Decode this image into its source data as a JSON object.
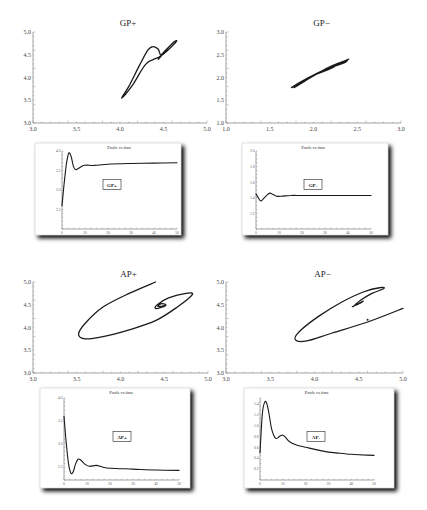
{
  "chart_data": [
    {
      "id": "gp-plus-phase",
      "type": "line",
      "title": "GP+",
      "xlabel": "",
      "ylabel": "",
      "xlim": [
        3.0,
        5.0
      ],
      "ylim": [
        3.0,
        5.0
      ],
      "xticks": [
        "3.0",
        "3.5",
        "4.0",
        "4.5",
        "5.0"
      ],
      "yticks": [
        "3.0",
        "3.5",
        "4.0",
        "4.5",
        "5.0"
      ],
      "grid": false,
      "series": [
        {
          "name": "trajectory",
          "points": [
            [
              4.45,
              4.42
            ],
            [
              4.6,
              4.75
            ],
            [
              4.65,
              4.8
            ],
            [
              4.55,
              4.6
            ],
            [
              4.45,
              4.45
            ],
            [
              4.3,
              4.3
            ],
            [
              4.15,
              3.85
            ],
            [
              4.02,
              3.55
            ],
            [
              4.1,
              3.8
            ],
            [
              4.22,
              4.25
            ],
            [
              4.32,
              4.6
            ],
            [
              4.38,
              4.68
            ],
            [
              4.44,
              4.62
            ],
            [
              4.47,
              4.5
            ],
            [
              4.55,
              4.65
            ],
            [
              4.62,
              4.78
            ],
            [
              4.5,
              4.55
            ],
            [
              4.44,
              4.4
            ]
          ]
        }
      ]
    },
    {
      "id": "gp-minus-phase",
      "type": "line",
      "title": "GP−",
      "xlabel": "",
      "ylabel": "",
      "xlim": [
        1.0,
        3.0
      ],
      "ylim": [
        1.0,
        3.0
      ],
      "xticks": [
        "1.0",
        "1.5",
        "2.0",
        "2.5",
        "3.0"
      ],
      "yticks": [
        "1.0",
        "1.5",
        "2.0",
        "2.5",
        "3.0"
      ],
      "grid": false,
      "series": [
        {
          "name": "trajectory",
          "points": [
            [
              2.3,
              2.32
            ],
            [
              2.4,
              2.4
            ],
            [
              2.2,
              2.2
            ],
            [
              1.95,
              2.0
            ],
            [
              1.75,
              1.78
            ],
            [
              1.85,
              1.9
            ],
            [
              2.05,
              2.1
            ],
            [
              2.25,
              2.28
            ],
            [
              2.38,
              2.38
            ],
            [
              2.35,
              2.32
            ],
            [
              2.2,
              2.22
            ],
            [
              2.0,
              2.05
            ],
            [
              1.78,
              1.78
            ],
            [
              1.9,
              1.92
            ],
            [
              2.15,
              2.2
            ],
            [
              2.32,
              2.34
            ]
          ]
        }
      ]
    },
    {
      "id": "gp-plus-time",
      "type": "line",
      "title": "Pools vs time",
      "annotation": "GP+",
      "xlim": [
        0,
        50
      ],
      "ylim": [
        2.0,
        4.0
      ],
      "xticks": [
        "0",
        "10",
        "20",
        "30",
        "40",
        "50"
      ],
      "yticks": [
        "2.5",
        "3.0",
        "3.5",
        "4.0"
      ],
      "series": [
        {
          "name": "pools",
          "points": [
            [
              0,
              2.6
            ],
            [
              1,
              3.2
            ],
            [
              2,
              3.7
            ],
            [
              3,
              3.95
            ],
            [
              4,
              3.85
            ],
            [
              5,
              3.6
            ],
            [
              6,
              3.52
            ],
            [
              7,
              3.55
            ],
            [
              9,
              3.62
            ],
            [
              11,
              3.64
            ],
            [
              14,
              3.63
            ],
            [
              20,
              3.66
            ],
            [
              30,
              3.68
            ],
            [
              40,
              3.69
            ],
            [
              50,
              3.7
            ]
          ]
        }
      ]
    },
    {
      "id": "gp-minus-time",
      "type": "line",
      "title": "Pools vs time",
      "annotation": "GP-",
      "xlim": [
        0,
        50
      ],
      "ylim": [
        1.0,
        2.0
      ],
      "xticks": [
        "0",
        "10",
        "20",
        "30",
        "40",
        "50"
      ],
      "yticks": [
        "1.2",
        "1.4",
        "1.6",
        "1.8",
        "2.0"
      ],
      "series": [
        {
          "name": "pools",
          "points": [
            [
              0,
              1.45
            ],
            [
              1,
              1.4
            ],
            [
              2,
              1.36
            ],
            [
              3,
              1.38
            ],
            [
              5,
              1.44
            ],
            [
              6,
              1.46
            ],
            [
              7,
              1.45
            ],
            [
              9,
              1.42
            ],
            [
              11,
              1.42
            ],
            [
              15,
              1.43
            ],
            [
              20,
              1.43
            ],
            [
              30,
              1.43
            ],
            [
              40,
              1.43
            ],
            [
              50,
              1.43
            ]
          ]
        }
      ]
    },
    {
      "id": "ap-plus-phase",
      "type": "line",
      "title": "AP+",
      "xlabel": "",
      "ylabel": "",
      "xlim": [
        3.0,
        5.0
      ],
      "ylim": [
        3.0,
        5.0
      ],
      "xticks": [
        "3.0",
        "3.5",
        "4.0",
        "4.5",
        "5.0"
      ],
      "yticks": [
        "3.0",
        "3.5",
        "4.0",
        "4.5",
        "5.0"
      ],
      "grid": false,
      "series": [
        {
          "name": "trajectory",
          "points": [
            [
              4.4,
              5.0
            ],
            [
              4.1,
              4.75
            ],
            [
              3.8,
              4.45
            ],
            [
              3.6,
              4.1
            ],
            [
              3.52,
              3.85
            ],
            [
              3.6,
              3.75
            ],
            [
              3.8,
              3.8
            ],
            [
              4.1,
              3.95
            ],
            [
              4.4,
              4.15
            ],
            [
              4.65,
              4.45
            ],
            [
              4.82,
              4.72
            ],
            [
              4.75,
              4.75
            ],
            [
              4.55,
              4.65
            ],
            [
              4.42,
              4.5
            ],
            [
              4.4,
              4.42
            ],
            [
              4.48,
              4.45
            ],
            [
              4.52,
              4.5
            ],
            [
              4.46,
              4.52
            ],
            [
              4.43,
              4.46
            ],
            [
              4.5,
              4.48
            ]
          ]
        }
      ]
    },
    {
      "id": "ap-minus-phase",
      "type": "line",
      "title": "AP−",
      "xlabel": "",
      "ylabel": "",
      "xlim": [
        3.0,
        5.0
      ],
      "ylim": [
        3.0,
        5.0
      ],
      "xticks": [
        "3.0",
        "3.5",
        "4.0",
        "4.5",
        "5.0"
      ],
      "yticks": [
        "3.0",
        "3.5",
        "4.0",
        "4.5",
        "5.0"
      ],
      "grid": false,
      "series": [
        {
          "name": "trajectory",
          "points": [
            [
              5.0,
              4.42
            ],
            [
              4.6,
              4.12
            ],
            [
              4.2,
              3.88
            ],
            [
              3.9,
              3.7
            ],
            [
              3.78,
              3.75
            ],
            [
              3.85,
              3.95
            ],
            [
              4.05,
              4.25
            ],
            [
              4.3,
              4.55
            ],
            [
              4.55,
              4.78
            ],
            [
              4.75,
              4.88
            ],
            [
              4.78,
              4.85
            ],
            [
              4.65,
              4.75
            ],
            [
              4.52,
              4.6
            ],
            [
              4.45,
              4.48
            ],
            [
              4.43,
              4.46
            ],
            [
              4.5,
              4.52
            ],
            [
              4.55,
              4.58
            ],
            [
              4.48,
              4.5
            ]
          ]
        }
      ],
      "marker_point": [
        4.6,
        4.17
      ]
    },
    {
      "id": "ap-plus-time",
      "type": "line",
      "title": "Pools vs time",
      "annotation": "AP+",
      "xlim": [
        0,
        50
      ],
      "ylim": [
        2.2,
        4.0
      ],
      "xticks": [
        "0",
        "10",
        "20",
        "30",
        "40",
        "50"
      ],
      "yticks": [
        "2.5",
        "3.0",
        "3.5",
        "4.0"
      ],
      "series": [
        {
          "name": "pools",
          "points": [
            [
              0,
              3.6
            ],
            [
              1,
              3.0
            ],
            [
              2,
              2.55
            ],
            [
              3,
              2.35
            ],
            [
              4,
              2.38
            ],
            [
              5,
              2.55
            ],
            [
              6,
              2.65
            ],
            [
              7,
              2.65
            ],
            [
              9,
              2.55
            ],
            [
              11,
              2.5
            ],
            [
              14,
              2.52
            ],
            [
              17,
              2.48
            ],
            [
              20,
              2.46
            ],
            [
              30,
              2.44
            ],
            [
              40,
              2.42
            ],
            [
              50,
              2.41
            ]
          ]
        }
      ]
    },
    {
      "id": "ap-minus-time",
      "type": "line",
      "title": "Pools vs time",
      "annotation": "AP-",
      "xlim": [
        0,
        50
      ],
      "ylim": [
        0.0,
        1.5
      ],
      "xticks": [
        "0",
        "10",
        "20",
        "30",
        "40",
        "50"
      ],
      "yticks": [
        "0.2",
        "0.4",
        "0.6",
        "0.8",
        "1.0",
        "1.2",
        "1.4"
      ],
      "series": [
        {
          "name": "pools",
          "points": [
            [
              0,
              0.5
            ],
            [
              1,
              1.2
            ],
            [
              2,
              1.42
            ],
            [
              3,
              1.4
            ],
            [
              4,
              1.2
            ],
            [
              5,
              0.95
            ],
            [
              6,
              0.82
            ],
            [
              7,
              0.76
            ],
            [
              8,
              0.78
            ],
            [
              9,
              0.81
            ],
            [
              10,
              0.82
            ],
            [
              11,
              0.79
            ],
            [
              13,
              0.7
            ],
            [
              16,
              0.64
            ],
            [
              20,
              0.6
            ],
            [
              25,
              0.55
            ],
            [
              30,
              0.51
            ],
            [
              35,
              0.49
            ],
            [
              40,
              0.47
            ],
            [
              45,
              0.46
            ],
            [
              50,
              0.45
            ]
          ]
        }
      ]
    }
  ]
}
